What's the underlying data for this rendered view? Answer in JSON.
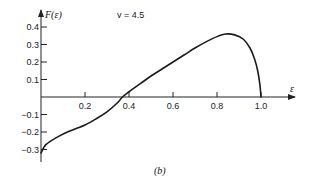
{
  "chart_data": {
    "type": "line",
    "title": "",
    "panel_label": "(b)",
    "xlabel": "ε",
    "ylabel": "F(ε)",
    "annotation": "v = 4.5",
    "xlim": [
      0,
      1.15
    ],
    "ylim": [
      -0.35,
      0.45
    ],
    "grid": false,
    "legend": "none",
    "x_ticks": [
      0.2,
      0.4,
      0.6,
      0.8,
      1.0
    ],
    "x_tick_labels": [
      "0.2",
      "0.4",
      "0.6",
      "0.8",
      "1.0"
    ],
    "y_ticks": [
      0.4,
      0.3,
      0.2,
      0.1,
      -0.1,
      -0.2,
      -0.3
    ],
    "y_tick_labels": [
      "0.4",
      "0.3",
      "0.2",
      "0.1",
      "−0.1",
      "−0.2",
      "−0.3"
    ],
    "series": [
      {
        "name": "F(ε), v = 4.5",
        "x": [
          0.0,
          0.01,
          0.02,
          0.04,
          0.08,
          0.12,
          0.16,
          0.2,
          0.25,
          0.3,
          0.35,
          0.37,
          0.4,
          0.45,
          0.5,
          0.55,
          0.6,
          0.65,
          0.7,
          0.75,
          0.8,
          0.84,
          0.88,
          0.92,
          0.95,
          0.97,
          0.985,
          0.995,
          1.0
        ],
        "y": [
          -0.32,
          -0.295,
          -0.275,
          -0.255,
          -0.225,
          -0.2,
          -0.18,
          -0.16,
          -0.125,
          -0.085,
          -0.03,
          0.0,
          0.03,
          0.075,
          0.12,
          0.16,
          0.2,
          0.24,
          0.28,
          0.315,
          0.345,
          0.36,
          0.355,
          0.33,
          0.28,
          0.22,
          0.15,
          0.07,
          0.0
        ]
      }
    ]
  }
}
